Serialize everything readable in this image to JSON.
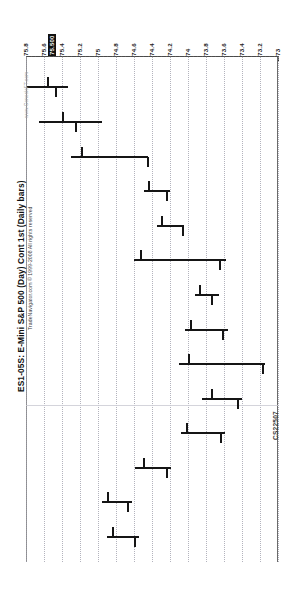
{
  "chart_data": {
    "type": "bar",
    "subtype": "ohlc-bar-chart",
    "title": "ES1-05S: E-Mini S&P 500 (Day) Cont 1st (Daily bars)",
    "attribution": "TradeNavigator.com © 1999-2008 All rights reserved",
    "watermark": "www.GenesisFT.com",
    "corner_code": "CS22507",
    "orientation": "rotated-90-clockwise",
    "xlabel": "",
    "ylabel": "Price",
    "grid": true,
    "legend": false,
    "price_axis": {
      "position": "top",
      "min": 73.0,
      "max": 75.8,
      "step": 0.2,
      "direction": "descending-left-to-right",
      "tick_labels": [
        "75.8",
        "75.6",
        "75.4",
        "75.2",
        "75",
        "74.8",
        "74.6",
        "74.4",
        "74.2",
        "74",
        "73.8",
        "73.6",
        "73.4",
        "73.2",
        "73"
      ],
      "highlighted_label": "75.500",
      "highlighted_value": 75.5
    },
    "bars": [
      {
        "index": 1,
        "high": 75.79,
        "low": 75.33,
        "open": 75.57,
        "close": 75.48
      },
      {
        "index": 2,
        "high": 75.66,
        "low": 74.95,
        "open": 75.4,
        "close": 75.26
      },
      {
        "index": 3,
        "high": 75.3,
        "low": 74.44,
        "open": 75.19,
        "close": 74.46
      },
      {
        "index": 4,
        "high": 74.49,
        "low": 74.2,
        "open": 74.45,
        "close": 74.24
      },
      {
        "index": 5,
        "high": 74.34,
        "low": 74.04,
        "open": 74.3,
        "close": 74.07
      },
      {
        "index": 6,
        "high": 74.6,
        "low": 73.58,
        "open": 74.53,
        "close": 73.66
      },
      {
        "index": 7,
        "high": 73.92,
        "low": 73.66,
        "open": 73.88,
        "close": 73.74
      },
      {
        "index": 8,
        "high": 74.03,
        "low": 73.56,
        "open": 73.98,
        "close": 73.62
      },
      {
        "index": 9,
        "high": 74.1,
        "low": 73.14,
        "open": 74.0,
        "close": 73.18
      },
      {
        "index": 10,
        "high": 73.84,
        "low": 73.4,
        "open": 73.74,
        "close": 73.46
      },
      {
        "index": 11,
        "high": 74.08,
        "low": 73.59,
        "open": 74.02,
        "close": 73.64
      },
      {
        "index": 12,
        "high": 74.59,
        "low": 74.19,
        "open": 74.5,
        "close": 74.24
      },
      {
        "index": 13,
        "high": 74.96,
        "low": 74.62,
        "open": 74.9,
        "close": 74.68
      },
      {
        "index": 14,
        "high": 74.9,
        "low": 74.55,
        "open": 74.84,
        "close": 74.6
      }
    ],
    "data_note": "OHLC daily bars; chart page scanned in landscape rotation"
  },
  "page": {
    "background_color": "#ffffff",
    "ink_color": "#151515",
    "grid_color": "#b9b9c4"
  }
}
